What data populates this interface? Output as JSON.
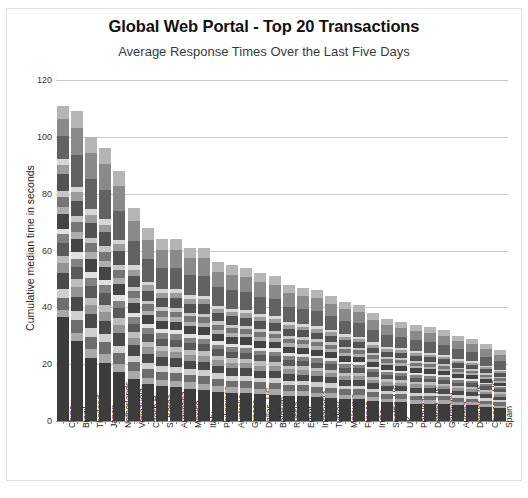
{
  "header": {
    "title": "Global Web Portal - Top 20 Transactions",
    "subtitle": "Average Response Times Over the Last Five Days"
  },
  "axis": {
    "ylabel": "Cumulative median time in seconds",
    "yticks": [
      "0",
      "20",
      "40",
      "60",
      "80",
      "100",
      "120"
    ]
  },
  "chart_data": {
    "type": "bar",
    "variant": "stacked-vertical",
    "title": "Global Web Portal - Top 20 Transactions",
    "subtitle": "Average Response Times Over the Last Five Days",
    "xlabel": "",
    "ylabel": "Cumulative median time in seconds",
    "ylim": [
      0,
      120
    ],
    "ytick_values": [
      0,
      20,
      40,
      60,
      80,
      100,
      120
    ],
    "grid": true,
    "legend": "none",
    "stack_note": "Each bar is a stack of 20 transaction segments rendered in alternating grayscale shades; totals are the cumulative median response time.",
    "categories": [
      "China",
      "Brazil",
      "Thailand",
      "Japan",
      "Netherlands",
      "Venezuela",
      "Czech R",
      "S. Korea",
      "Argentina",
      "Mexico",
      "Italy",
      "Philippines",
      "Australia",
      "Greece",
      "Dallas, US",
      "Belgium",
      "Russia",
      "Egypt",
      "Indonesia",
      "Turkey",
      "Malaysia",
      "France",
      "India",
      "Seattle, US",
      "UK",
      "Portugal",
      "Detroit, US",
      "Germany",
      "Austria",
      "Denver, US",
      "Chicago, US",
      "Spain"
    ],
    "totals": [
      111,
      109,
      100,
      96,
      88,
      75,
      68,
      64,
      64,
      61,
      61,
      56,
      55,
      54,
      52,
      51,
      48,
      47,
      46,
      44,
      42,
      41,
      38,
      36,
      35,
      34,
      33,
      32,
      30,
      29,
      27,
      25
    ],
    "segment_shades": [
      "#3c3c3c",
      "#a8a8a8",
      "#6e6e6e",
      "#cfcfcf",
      "#4a4a4a",
      "#949494",
      "#bdbdbd",
      "#5a5a5a",
      "#818181",
      "#e0e0e0",
      "#444444",
      "#aeaeae",
      "#767676",
      "#c6c6c6",
      "#535353",
      "#9c9c9c",
      "#d6d6d6",
      "#626262",
      "#8a8a8a",
      "#b5b5b5"
    ],
    "series": [
      {
        "name": "Segment 1",
        "values": [
          36.0,
          28.0,
          22.0,
          19.5,
          16.0,
          14.0,
          12.0,
          11.5,
          11.0,
          10.5,
          10.0,
          9.5,
          9.0,
          9.0,
          8.5,
          8.5,
          8.0,
          8.0,
          7.5,
          7.5,
          7.0,
          7.0,
          6.5,
          6.0,
          6.0,
          5.5,
          5.5,
          5.5,
          5.0,
          5.0,
          4.5,
          4.0
        ]
      },
      {
        "name": "Segment 2",
        "values": [
          2.5,
          3.0,
          3.0,
          3.0,
          2.6,
          2.4,
          2.2,
          2.1,
          2.1,
          2.0,
          2.0,
          1.9,
          1.8,
          1.8,
          1.7,
          1.7,
          1.6,
          1.6,
          1.5,
          1.5,
          1.4,
          1.4,
          1.3,
          1.2,
          1.2,
          1.1,
          1.1,
          1.1,
          1.0,
          1.0,
          0.9,
          0.9
        ]
      },
      {
        "name": "Segment 3",
        "values": [
          4.0,
          4.5,
          4.2,
          4.0,
          3.6,
          3.0,
          2.8,
          2.6,
          2.6,
          2.5,
          2.5,
          2.3,
          2.2,
          2.2,
          2.1,
          2.1,
          2.0,
          2.0,
          1.9,
          1.8,
          1.7,
          1.7,
          1.6,
          1.5,
          1.5,
          1.4,
          1.4,
          1.3,
          1.2,
          1.2,
          1.1,
          1.0
        ]
      },
      {
        "name": "Segment 4",
        "values": [
          3.0,
          3.2,
          3.0,
          2.8,
          2.6,
          2.2,
          2.0,
          1.9,
          1.9,
          1.8,
          1.8,
          1.7,
          1.6,
          1.6,
          1.5,
          1.5,
          1.4,
          1.4,
          1.4,
          1.3,
          1.2,
          1.2,
          1.1,
          1.1,
          1.0,
          1.0,
          1.0,
          0.9,
          0.9,
          0.9,
          0.8,
          0.7
        ]
      },
      {
        "name": "Segment 5",
        "values": [
          5.5,
          5.0,
          4.8,
          4.5,
          4.0,
          3.4,
          3.0,
          2.9,
          2.9,
          2.7,
          2.7,
          2.5,
          2.4,
          2.4,
          2.3,
          2.3,
          2.1,
          2.1,
          2.0,
          2.0,
          1.9,
          1.8,
          1.7,
          1.6,
          1.6,
          1.5,
          1.5,
          1.4,
          1.3,
          1.3,
          1.2,
          1.1
        ]
      },
      {
        "name": "Segment 6",
        "values": [
          3.5,
          3.5,
          3.2,
          3.0,
          2.8,
          2.4,
          2.1,
          2.0,
          2.0,
          1.9,
          1.9,
          1.8,
          1.7,
          1.7,
          1.6,
          1.6,
          1.5,
          1.5,
          1.4,
          1.4,
          1.3,
          1.3,
          1.2,
          1.1,
          1.1,
          1.1,
          1.0,
          1.0,
          0.9,
          0.9,
          0.8,
          0.8
        ]
      },
      {
        "name": "Segment 7",
        "values": [
          2.5,
          2.8,
          2.6,
          2.5,
          2.2,
          1.9,
          1.7,
          1.6,
          1.6,
          1.5,
          1.5,
          1.4,
          1.4,
          1.4,
          1.3,
          1.3,
          1.2,
          1.2,
          1.1,
          1.1,
          1.0,
          1.0,
          1.0,
          0.9,
          0.9,
          0.8,
          0.8,
          0.8,
          0.7,
          0.7,
          0.7,
          0.6
        ]
      },
      {
        "name": "Segment 8",
        "values": [
          4.5,
          4.2,
          4.0,
          3.8,
          3.4,
          2.9,
          2.6,
          2.5,
          2.5,
          2.3,
          2.3,
          2.1,
          2.1,
          2.0,
          2.0,
          1.9,
          1.8,
          1.8,
          1.7,
          1.7,
          1.6,
          1.5,
          1.4,
          1.4,
          1.3,
          1.3,
          1.2,
          1.2,
          1.1,
          1.1,
          1.0,
          0.9
        ]
      },
      {
        "name": "Segment 9",
        "values": [
          3.0,
          3.0,
          2.8,
          2.7,
          2.4,
          2.1,
          1.9,
          1.8,
          1.8,
          1.7,
          1.7,
          1.5,
          1.5,
          1.5,
          1.4,
          1.4,
          1.3,
          1.3,
          1.3,
          1.2,
          1.1,
          1.1,
          1.0,
          1.0,
          1.0,
          0.9,
          0.9,
          0.9,
          0.8,
          0.8,
          0.7,
          0.7
        ]
      },
      {
        "name": "Segment 10",
        "values": [
          2.0,
          2.2,
          2.0,
          1.9,
          1.7,
          1.5,
          1.3,
          1.3,
          1.3,
          1.2,
          1.2,
          1.1,
          1.1,
          1.1,
          1.0,
          1.0,
          1.0,
          0.9,
          0.9,
          0.9,
          0.8,
          0.8,
          0.8,
          0.7,
          0.7,
          0.7,
          0.6,
          0.6,
          0.6,
          0.6,
          0.5,
          0.5
        ]
      },
      {
        "name": "Segment 11",
        "values": [
          5.0,
          4.8,
          4.5,
          4.2,
          3.8,
          3.2,
          2.9,
          2.7,
          2.7,
          2.6,
          2.6,
          2.4,
          2.3,
          2.3,
          2.2,
          2.2,
          2.0,
          2.0,
          1.9,
          1.9,
          1.8,
          1.7,
          1.6,
          1.5,
          1.5,
          1.4,
          1.4,
          1.3,
          1.3,
          1.2,
          1.1,
          1.0
        ]
      },
      {
        "name": "Segment 12",
        "values": [
          2.5,
          2.5,
          2.4,
          2.2,
          2.0,
          1.7,
          1.5,
          1.5,
          1.5,
          1.4,
          1.4,
          1.3,
          1.2,
          1.2,
          1.2,
          1.1,
          1.1,
          1.1,
          1.0,
          1.0,
          0.9,
          0.9,
          0.9,
          0.8,
          0.8,
          0.8,
          0.7,
          0.7,
          0.7,
          0.6,
          0.6,
          0.6
        ]
      },
      {
        "name": "Segment 13",
        "values": [
          3.5,
          3.4,
          3.2,
          3.0,
          2.7,
          2.3,
          2.1,
          1.9,
          1.9,
          1.8,
          1.8,
          1.7,
          1.7,
          1.6,
          1.6,
          1.5,
          1.5,
          1.4,
          1.4,
          1.3,
          1.3,
          1.2,
          1.2,
          1.1,
          1.1,
          1.0,
          1.0,
          1.0,
          0.9,
          0.9,
          0.8,
          0.8
        ]
      },
      {
        "name": "Segment 14",
        "values": [
          2.0,
          2.0,
          1.9,
          1.8,
          1.6,
          1.4,
          1.2,
          1.2,
          1.2,
          1.1,
          1.1,
          1.0,
          1.0,
          1.0,
          0.9,
          0.9,
          0.9,
          0.9,
          0.8,
          0.8,
          0.8,
          0.7,
          0.7,
          0.7,
          0.6,
          0.6,
          0.6,
          0.6,
          0.5,
          0.5,
          0.5,
          0.5
        ]
      },
      {
        "name": "Segment 15",
        "values": [
          6.0,
          5.5,
          5.2,
          4.8,
          4.4,
          3.7,
          3.3,
          3.1,
          3.1,
          3.0,
          3.0,
          2.7,
          2.7,
          2.6,
          2.5,
          2.5,
          2.3,
          2.3,
          2.2,
          2.1,
          2.0,
          2.0,
          1.8,
          1.7,
          1.7,
          1.6,
          1.6,
          1.5,
          1.4,
          1.4,
          1.3,
          1.2
        ]
      },
      {
        "name": "Segment 16",
        "values": [
          3.0,
          2.9,
          2.7,
          2.6,
          2.3,
          2.0,
          1.8,
          1.7,
          1.7,
          1.6,
          1.6,
          1.4,
          1.4,
          1.4,
          1.3,
          1.3,
          1.2,
          1.2,
          1.2,
          1.1,
          1.1,
          1.0,
          1.0,
          0.9,
          0.9,
          0.9,
          0.8,
          0.8,
          0.8,
          0.7,
          0.7,
          0.6
        ]
      },
      {
        "name": "Segment 17",
        "values": [
          2.0,
          2.0,
          1.9,
          1.8,
          1.6,
          1.4,
          1.2,
          1.2,
          1.2,
          1.1,
          1.1,
          1.0,
          1.0,
          1.0,
          0.9,
          0.9,
          0.9,
          0.9,
          0.8,
          0.8,
          0.8,
          0.7,
          0.7,
          0.7,
          0.6,
          0.6,
          0.6,
          0.6,
          0.5,
          0.5,
          0.5,
          0.4
        ]
      },
      {
        "name": "Segment 18",
        "values": [
          8.0,
          11.0,
          10.5,
          10.0,
          9.5,
          8.0,
          7.5,
          7.0,
          7.0,
          6.5,
          6.5,
          6.0,
          6.0,
          5.8,
          5.5,
          5.4,
          5.0,
          5.0,
          4.8,
          4.6,
          4.4,
          4.3,
          4.0,
          3.8,
          3.6,
          3.5,
          3.4,
          3.3,
          3.1,
          3.0,
          2.8,
          2.6
        ]
      },
      {
        "name": "Segment 19",
        "values": [
          6.0,
          9.5,
          9.0,
          8.5,
          8.0,
          6.8,
          6.2,
          5.8,
          5.8,
          5.5,
          5.5,
          5.0,
          5.0,
          4.9,
          4.7,
          4.6,
          4.3,
          4.2,
          4.0,
          3.9,
          3.7,
          3.6,
          3.4,
          3.2,
          3.1,
          3.0,
          2.9,
          2.8,
          2.6,
          2.5,
          2.4,
          2.2
        ]
      },
      {
        "name": "Segment 20",
        "values": [
          4.5,
          6.0,
          5.6,
          5.4,
          5.0,
          4.2,
          3.8,
          3.6,
          3.6,
          3.4,
          3.4,
          3.1,
          3.1,
          3.0,
          2.9,
          2.8,
          2.7,
          2.6,
          2.5,
          2.4,
          2.3,
          2.3,
          2.1,
          2.0,
          1.9,
          1.9,
          1.8,
          1.8,
          1.6,
          1.6,
          1.5,
          1.4
        ]
      }
    ]
  }
}
